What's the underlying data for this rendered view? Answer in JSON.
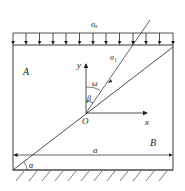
{
  "diagram": {
    "load_label": "σₐ",
    "ray_label": "σ₁",
    "region_a": "A",
    "region_b": "B",
    "axis_y": "y",
    "axis_x": "x",
    "origin": "O",
    "angle_omega": "ω",
    "angle_beta": "β",
    "angle_alpha": "α",
    "width_label": "a",
    "colors": {
      "line": "#222222",
      "background": "#ffffff"
    }
  }
}
